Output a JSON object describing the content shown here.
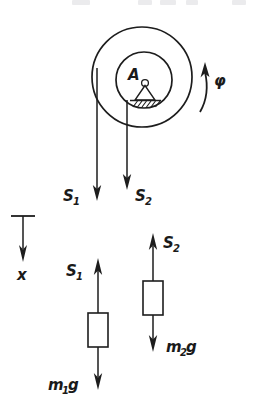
{
  "figure": {
    "ink_color": "#1d1d1d",
    "background_color": "#ffffff",
    "width": 254,
    "height": 420
  },
  "pulley": {
    "name": "stepped-pulley",
    "support_label": "A",
    "outer_circle": {
      "cx": 142,
      "cy": 77,
      "r": 50
    },
    "inner_circle": {
      "cx": 144,
      "cy": 80,
      "r": 28
    },
    "support_type": "pinned-hatched-ground",
    "rotation": {
      "symbol": "φ",
      "direction": "counterclockwise-upward",
      "arrow": "curved-arc-arrow"
    }
  },
  "axis": {
    "name": "x-axis-indicator",
    "label": "x",
    "direction": "downward",
    "origin_bar": "horizontal-tick"
  },
  "rope_forces_top": [
    {
      "label": "S",
      "subscript": "1",
      "direction": "down",
      "x": 97
    },
    {
      "label": "S",
      "subscript": "2",
      "direction": "down",
      "x": 127
    }
  ],
  "bodies": [
    {
      "name": "mass-1",
      "tension": {
        "label": "S",
        "subscript": "1",
        "direction": "up"
      },
      "weight": {
        "label": "m",
        "subscript": "1",
        "trailing": "g",
        "direction": "down"
      }
    },
    {
      "name": "mass-2",
      "tension": {
        "label": "S",
        "subscript": "2",
        "direction": "up"
      },
      "weight": {
        "label": "m",
        "subscript": "2",
        "trailing": "g",
        "direction": "down"
      }
    }
  ],
  "labels": {
    "s1_top": "S",
    "s1_top_sub": "1",
    "s2_top": "S",
    "s2_top_sub": "2",
    "s1_bottom": "S",
    "s1_bottom_sub": "1",
    "s2_bottom": "S",
    "s2_bottom_sub": "2",
    "m1g": "m",
    "m1g_sub": "1",
    "m1g_tail": "g",
    "m2g": "m",
    "m2g_sub": "2",
    "m2g_tail": "g",
    "phi": "φ",
    "x": "x",
    "A": "A"
  }
}
